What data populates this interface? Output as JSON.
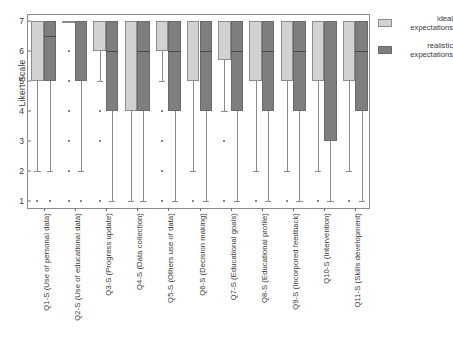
{
  "chart_data": {
    "type": "box",
    "title": "",
    "xlabel": "",
    "ylabel": "Likert Scale",
    "ylim": [
      1,
      7
    ],
    "yticks": [
      1,
      2,
      3,
      4,
      5,
      6,
      7
    ],
    "grid": false,
    "legend_position": "right",
    "categories": [
      "Q1-S (Use of personal data)",
      "Q2-S (Use of educational data)",
      "Q3-S (Progress update)",
      "Q4-S (Data collection)",
      "Q5-S (Others use of data)",
      "Q6-S (Decision making)",
      "Q7-S (Educational goals)",
      "Q8-S (Educational profile)",
      "Q9-S (Incorpored feedback)",
      "Q10-S (Intervention)",
      "Q11-S (Skills development)"
    ],
    "series": [
      {
        "name": "ideal expectations",
        "color": "#d2d2d2",
        "boxes": [
          {
            "q1": 5,
            "median": 7,
            "q3": 7,
            "whisker_low": 2,
            "whisker_high": 7,
            "outliers": [
              1
            ]
          },
          {
            "q1": 7,
            "median": 7,
            "q3": 7,
            "whisker_low": 7,
            "whisker_high": 7,
            "outliers": [
              6,
              5,
              4,
              3,
              2,
              1
            ]
          },
          {
            "q1": 6,
            "median": 7,
            "q3": 7,
            "whisker_low": 5,
            "whisker_high": 7,
            "outliers": [
              4,
              3,
              1
            ]
          },
          {
            "q1": 4,
            "median": 7,
            "q3": 7,
            "whisker_low": 1,
            "whisker_high": 7,
            "outliers": []
          },
          {
            "q1": 6,
            "median": 7,
            "q3": 7,
            "whisker_low": 5,
            "whisker_high": 7,
            "outliers": [
              4,
              3,
              2,
              1
            ]
          },
          {
            "q1": 5,
            "median": 7,
            "q3": 7,
            "whisker_low": 2,
            "whisker_high": 7,
            "outliers": [
              1
            ]
          },
          {
            "q1": 5.7,
            "median": 7,
            "q3": 7,
            "whisker_low": 4,
            "whisker_high": 7,
            "outliers": [
              3,
              1
            ]
          },
          {
            "q1": 5,
            "median": 7,
            "q3": 7,
            "whisker_low": 2,
            "whisker_high": 7,
            "outliers": [
              1
            ]
          },
          {
            "q1": 5,
            "median": 7,
            "q3": 7,
            "whisker_low": 2,
            "whisker_high": 7,
            "outliers": [
              1
            ]
          },
          {
            "q1": 5,
            "median": 7,
            "q3": 7,
            "whisker_low": 2,
            "whisker_high": 7,
            "outliers": [
              1
            ]
          },
          {
            "q1": 5,
            "median": 7,
            "q3": 7,
            "whisker_low": 2,
            "whisker_high": 7,
            "outliers": [
              1
            ]
          }
        ]
      },
      {
        "name": "realistic expectations",
        "color": "#7e7e7e",
        "boxes": [
          {
            "q1": 5,
            "median": 6.5,
            "q3": 7,
            "whisker_low": 2,
            "whisker_high": 7,
            "outliers": [
              1
            ]
          },
          {
            "q1": 5,
            "median": 7,
            "q3": 7,
            "whisker_low": 2,
            "whisker_high": 7,
            "outliers": [
              1
            ]
          },
          {
            "q1": 4,
            "median": 6,
            "q3": 7,
            "whisker_low": 1,
            "whisker_high": 7,
            "outliers": []
          },
          {
            "q1": 4,
            "median": 6,
            "q3": 7,
            "whisker_low": 1,
            "whisker_high": 7,
            "outliers": []
          },
          {
            "q1": 4,
            "median": 6,
            "q3": 7,
            "whisker_low": 1,
            "whisker_high": 7,
            "outliers": []
          },
          {
            "q1": 4,
            "median": 6,
            "q3": 7,
            "whisker_low": 1,
            "whisker_high": 7,
            "outliers": []
          },
          {
            "q1": 4,
            "median": 6,
            "q3": 7,
            "whisker_low": 1,
            "whisker_high": 7,
            "outliers": []
          },
          {
            "q1": 4,
            "median": 6,
            "q3": 7,
            "whisker_low": 1,
            "whisker_high": 7,
            "outliers": []
          },
          {
            "q1": 4,
            "median": 6,
            "q3": 7,
            "whisker_low": 1,
            "whisker_high": 7,
            "outliers": []
          },
          {
            "q1": 3,
            "median": 7,
            "q3": 7,
            "whisker_low": 1,
            "whisker_high": 7,
            "outliers": []
          },
          {
            "q1": 4,
            "median": 6,
            "q3": 7,
            "whisker_low": 1,
            "whisker_high": 7,
            "outliers": []
          }
        ]
      }
    ]
  },
  "legend": {
    "items": [
      {
        "label": "ideal expectations",
        "line1": "ideal",
        "line2": "expectations"
      },
      {
        "label": "realistic expectations",
        "line1": "realistic",
        "line2": "expectations"
      }
    ]
  }
}
